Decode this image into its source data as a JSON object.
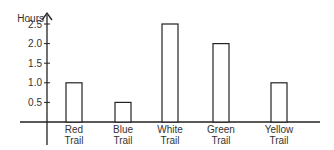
{
  "chart_data": {
    "type": "bar",
    "title": "",
    "xlabel": "",
    "ylabel": "Hours",
    "categories": [
      "Red Trail",
      "Blue Trail",
      "White Trail",
      "Green Trail",
      "Yellow Trail"
    ],
    "category_lines": [
      [
        "Red",
        "Trail"
      ],
      [
        "Blue",
        "Trail"
      ],
      [
        "White",
        "Trail"
      ],
      [
        "Green",
        "Trail"
      ],
      [
        "Yellow",
        "Trail"
      ]
    ],
    "values": [
      1.0,
      0.5,
      2.5,
      2.0,
      1.0
    ],
    "yticks": [
      "0.5",
      "1.0",
      "1.5",
      "2.0",
      "2.5"
    ],
    "ytick_values": [
      0.5,
      1.0,
      1.5,
      2.0,
      2.5
    ],
    "ylim": [
      0,
      2.7
    ],
    "grid": false,
    "legend": null,
    "bar_fill": "#ffffff",
    "bar_stroke": "#222222"
  }
}
